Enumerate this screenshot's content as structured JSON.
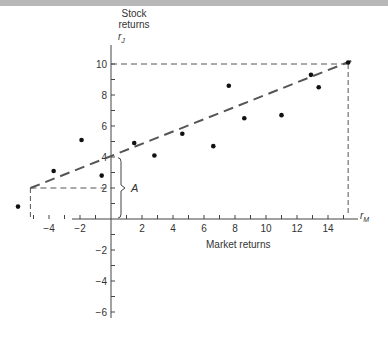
{
  "chart_data": {
    "type": "scatter",
    "title": "",
    "xlabel": "Market returns",
    "ylabel": "Stock returns",
    "x_axis_symbol": "r_M",
    "y_axis_symbol": "r_J",
    "x_ticks": [
      -4,
      -2,
      2,
      4,
      6,
      8,
      10,
      12,
      14
    ],
    "y_ticks": [
      -6,
      -4,
      -2,
      2,
      4,
      6,
      8,
      10
    ],
    "xlim": [
      -6.5,
      16
    ],
    "ylim": [
      -7,
      11
    ],
    "grid": false,
    "series": [
      {
        "name": "observations",
        "points": [
          {
            "x": -6.0,
            "y": 0.8
          },
          {
            "x": -3.7,
            "y": 3.1
          },
          {
            "x": -1.9,
            "y": 5.1
          },
          {
            "x": -0.6,
            "y": 2.8
          },
          {
            "x": 1.5,
            "y": 4.9
          },
          {
            "x": 2.8,
            "y": 4.1
          },
          {
            "x": 4.6,
            "y": 5.5
          },
          {
            "x": 6.6,
            "y": 4.7
          },
          {
            "x": 7.6,
            "y": 8.6
          },
          {
            "x": 8.6,
            "y": 6.5
          },
          {
            "x": 11.0,
            "y": 6.7
          },
          {
            "x": 12.9,
            "y": 9.3
          },
          {
            "x": 13.4,
            "y": 8.5
          },
          {
            "x": 15.3,
            "y": 10.1
          }
        ]
      }
    ],
    "regression_line": {
      "x1": -5.2,
      "y1": 2.0,
      "x2": 15.5,
      "y2": 10.2,
      "style": "dashed"
    },
    "annotations": [
      {
        "label": "A",
        "description": "intercept brace from 0 to ~3.9 on y-axis"
      },
      {
        "label": "guide",
        "description": "dashed lines at y=2 to x=-5.2 and y=10 to x=15.3"
      }
    ]
  },
  "labels": {
    "ylabel_line1": "Stock",
    "ylabel_line2": "returns",
    "y_symbol": "r",
    "y_sub": "J",
    "x_symbol": "r",
    "x_sub": "M",
    "xlabel": "Market returns",
    "brace_label": "A"
  }
}
